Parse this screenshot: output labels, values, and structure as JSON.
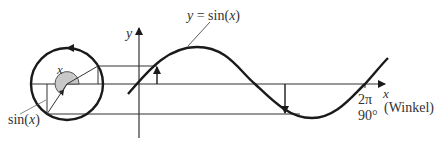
{
  "diagram": {
    "type": "unit-circle-to-sine-projection",
    "colors": {
      "stroke": "#1a1a1a",
      "thin_line": "#333333",
      "angle_fill": "#c8c8c8",
      "text": "#333333"
    },
    "labels": {
      "curve_label": "y = sin(x)",
      "curve_label_y": "y",
      "curve_label_eq": " = sin(",
      "curve_label_x": "x",
      "curve_label_close": ")",
      "y_axis": "y",
      "x_axis": "x",
      "angle": "x",
      "sin_label_prefix": "sin(",
      "sin_label_var": "x",
      "sin_label_suffix": ")",
      "period_radians": "2π",
      "period_degrees": "90°",
      "angle_unit": "(Winkel)"
    }
  }
}
